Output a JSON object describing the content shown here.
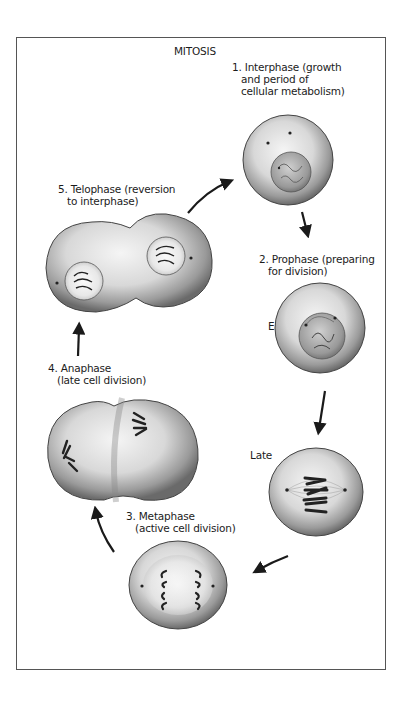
{
  "diagram": {
    "title": "MITOSIS",
    "stages": [
      {
        "number": "1.",
        "name": "Interphase",
        "line1": "1. Interphase  (growth",
        "line2": "and period of",
        "line3": "cellular metabolism)"
      },
      {
        "number": "2.",
        "name": "Prophase",
        "line1": "2. Prophase (preparing",
        "line2": "for division)",
        "sublabels": [
          "Early",
          "Late"
        ]
      },
      {
        "number": "3.",
        "name": "Metaphase",
        "line1": "3. Metaphase",
        "line2": "(active cell division)"
      },
      {
        "number": "4.",
        "name": "Anaphase",
        "line1": "4. Anaphase",
        "line2": "(late cell division)"
      },
      {
        "number": "5.",
        "name": "Telophase",
        "line1": "5. Telophase (reversion",
        "line2": "to interphase)"
      }
    ],
    "cycle_order": [
      "Interphase",
      "Prophase Early",
      "Prophase Late",
      "Metaphase",
      "Anaphase",
      "Telophase",
      "Interphase"
    ],
    "colors": {
      "ink": "#1a1a1a",
      "frame": "#555555",
      "cell_fill": "#e6e6e6",
      "cell_shade": "#8a8a8a"
    }
  }
}
